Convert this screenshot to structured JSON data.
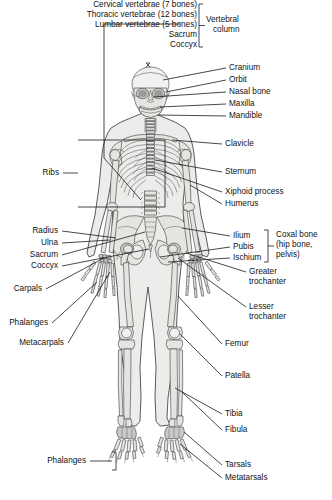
{
  "figure": {
    "type": "anatomical-diagram",
    "view": "anterior",
    "background_color": "#ffffff",
    "bone_fill_color": "#e9e9e7",
    "outline_color": "#2a2a2a",
    "label_color": "#111111"
  },
  "groups": {
    "vertebral_column": {
      "bracket_label": "Vertebral\ncolumn",
      "bracket_label_line1": "Vertebral",
      "bracket_label_line2": "column",
      "members": [
        "Cervical vertebrae (7 bones)",
        "Thoracic vertebrae (12 bones)",
        "Lumbar vertebrae (5 bones)",
        "Sacrum",
        "Coccyx"
      ]
    },
    "coxal_bone": {
      "bracket_label_line1": "Coxal bone",
      "bracket_label_line2": "(hip bone,",
      "bracket_label_line3": "pelvis)",
      "members": [
        "Ilium",
        "Pubis",
        "Ischium"
      ]
    }
  },
  "labels": {
    "top_stack": [
      {
        "id": "cervical-vertebrae",
        "text": "Cervical vertebrae (7 bones)"
      },
      {
        "id": "thoracic-vertebrae",
        "text": "Thoracic vertebrae (12 bones)"
      },
      {
        "id": "lumbar-vertebrae",
        "text": "Lumbar vertebrae (5 bones)"
      },
      {
        "id": "sacrum-top",
        "text": "Sacrum"
      },
      {
        "id": "coccyx-top",
        "text": "Coccyx"
      }
    ],
    "vertebral_column_1": "Vertebral",
    "vertebral_column_2": "column",
    "right": [
      {
        "id": "cranium",
        "text": "Cranium"
      },
      {
        "id": "orbit",
        "text": "Orbit"
      },
      {
        "id": "nasal-bone",
        "text": "Nasal bone"
      },
      {
        "id": "maxilla",
        "text": "Maxilla"
      },
      {
        "id": "mandible",
        "text": "Mandible"
      },
      {
        "id": "clavicle",
        "text": "Clavicle"
      },
      {
        "id": "sternum",
        "text": "Sternum"
      },
      {
        "id": "xiphoid-process",
        "text": "Xiphoid process"
      },
      {
        "id": "humerus",
        "text": "Humerus"
      },
      {
        "id": "ilium",
        "text": "Ilium"
      },
      {
        "id": "pubis",
        "text": "Pubis"
      },
      {
        "id": "ischium",
        "text": "Ischium"
      },
      {
        "id": "femur",
        "text": "Femur"
      },
      {
        "id": "patella",
        "text": "Patella"
      },
      {
        "id": "tibia",
        "text": "Tibia"
      },
      {
        "id": "fibula",
        "text": "Fibula"
      },
      {
        "id": "tarsals",
        "text": "Tarsals"
      },
      {
        "id": "metatarsals",
        "text": "Metatarsals"
      }
    ],
    "coxal_1": "Coxal bone",
    "coxal_2": "(hip bone,",
    "coxal_3": "pelvis)",
    "greater_1": "Greater",
    "greater_2": "trochanter",
    "lesser_1": "Lesser",
    "lesser_2": "trochanter",
    "left": [
      {
        "id": "ribs",
        "text": "Ribs"
      },
      {
        "id": "radius",
        "text": "Radius"
      },
      {
        "id": "ulna",
        "text": "Ulna"
      },
      {
        "id": "sacrum",
        "text": "Sacrum"
      },
      {
        "id": "coccyx",
        "text": "Coccyx"
      },
      {
        "id": "carpals",
        "text": "Carpals"
      },
      {
        "id": "phalanges-hand",
        "text": "Phalanges"
      },
      {
        "id": "metacarpals",
        "text": "Metacarpals"
      },
      {
        "id": "phalanges-foot",
        "text": "Phalanges"
      }
    ]
  }
}
